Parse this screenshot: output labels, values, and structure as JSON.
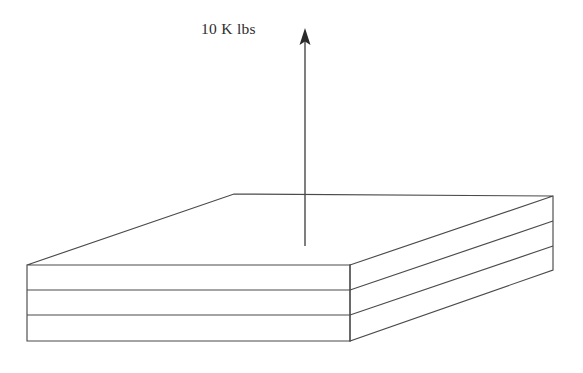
{
  "figure": {
    "kind": "engineering-sketch",
    "background_color": "#ffffff",
    "line_color": "#4a4a4a",
    "arrow_color": "#2b2b2b"
  },
  "annotations": {
    "load_label": "10 K lbs"
  },
  "load_arrow": {
    "direction": "up",
    "x": 305,
    "tail_y": 246,
    "tip_y": 28,
    "head_width": 11,
    "head_height": 16
  },
  "slab": {
    "layer_count": 3,
    "top_face": {
      "front_left": [
        27,
        265
      ],
      "back_left": [
        234,
        194
      ],
      "back_right": [
        553,
        196
      ],
      "front_right": [
        350,
        265
      ]
    },
    "front_left_face": {
      "top_left": [
        27,
        265
      ],
      "top_right": [
        350,
        265
      ],
      "bottom_right": [
        350,
        341
      ],
      "bottom_left": [
        27,
        341
      ]
    },
    "front_right_face": {
      "top_front": [
        350,
        265
      ],
      "top_back": [
        553,
        196
      ],
      "bottom_back": [
        553,
        270
      ],
      "bottom_front": [
        350,
        341
      ]
    },
    "lamina_divider_left_ys": [
      290,
      315
    ],
    "lamina_divider_right_ys": [
      221,
      246
    ]
  }
}
